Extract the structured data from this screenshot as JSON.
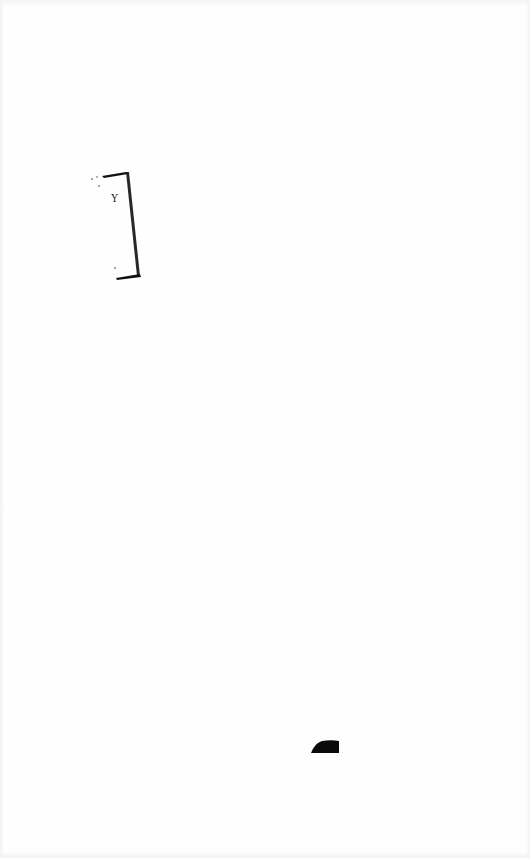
{
  "document": {
    "type": "scanned-page",
    "background": "#fefefe",
    "ink_color": "#111111",
    "marks": [
      {
        "kind": "hand-drawn-bracket",
        "label": "Y",
        "position": {
          "x": 88,
          "y": 166,
          "width": 60,
          "height": 120
        }
      },
      {
        "kind": "ink-blob",
        "position": {
          "x": 310,
          "y": 740,
          "width": 30,
          "height": 13
        }
      }
    ]
  }
}
